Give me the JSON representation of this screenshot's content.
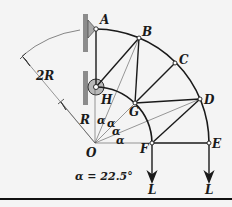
{
  "diagram": {
    "equation": "α = 22.5°",
    "joints": [
      {
        "id": "A",
        "label": "A"
      },
      {
        "id": "B",
        "label": "B"
      },
      {
        "id": "C",
        "label": "C"
      },
      {
        "id": "D",
        "label": "D"
      },
      {
        "id": "E",
        "label": "E"
      },
      {
        "id": "F",
        "label": "F"
      },
      {
        "id": "G",
        "label": "G"
      },
      {
        "id": "H",
        "label": "H"
      },
      {
        "id": "O",
        "label": "O"
      }
    ],
    "dimensions": {
      "outer_radius": "2R",
      "inner_radius": "R"
    },
    "angle_labels": [
      "α",
      "α",
      "α",
      "α"
    ],
    "loads": [
      {
        "at": "F",
        "label": "L"
      },
      {
        "at": "E",
        "label": "L"
      }
    ],
    "colors": {
      "background": "#f4f4f4",
      "line": "#1a1a1a",
      "wall": "#8c8c8c",
      "support": "#a8a8a8"
    }
  }
}
